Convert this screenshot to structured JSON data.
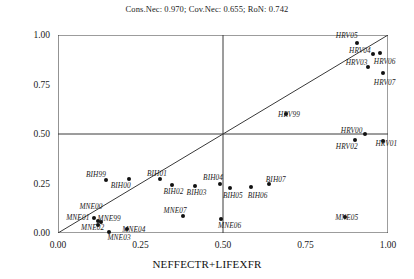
{
  "fit_stats": "Cons.Nec: 0.970; Cov.Nec: 0.655; RoN: 0.742",
  "axes": {
    "xlabel": "NEFFECTR+LIFEXFR",
    "ylabel": "OWNR",
    "xticks": [
      "0.00",
      "0.25",
      "0.50",
      "0.75",
      "1.00"
    ],
    "yticks": [
      "0.00",
      "0.25",
      "0.50",
      "0.75",
      "1.00"
    ]
  },
  "chart_data": {
    "type": "scatter",
    "title": "Cons.Nec: 0.970; Cov.Nec: 0.655; RoN: 0.742",
    "xlabel": "NEFFECTR+LIFEXFR",
    "ylabel": "OWNR",
    "xlim": [
      0.0,
      1.0
    ],
    "ylim": [
      0.0,
      1.0
    ],
    "xticks": [
      0.0,
      0.25,
      0.5,
      0.75,
      1.0
    ],
    "yticks": [
      0.0,
      0.25,
      0.5,
      0.75,
      1.0
    ],
    "grid": false,
    "legend": false,
    "reference_lines": [
      {
        "name": "diagonal",
        "type": "line",
        "from": [
          0.0,
          0.0
        ],
        "to": [
          1.0,
          1.0
        ]
      },
      {
        "name": "vline-0.50",
        "type": "vline",
        "x": 0.5
      },
      {
        "name": "hline-0.50",
        "type": "hline",
        "y": 0.5
      },
      {
        "name": "vline-1.00",
        "type": "vline",
        "x": 1.0
      },
      {
        "name": "hline-1.00",
        "type": "hline",
        "y": 1.0
      }
    ],
    "points": [
      {
        "label": "HRV05",
        "x": 0.905,
        "y": 0.96,
        "lx": 0.875,
        "ly": 1.0
      },
      {
        "label": "HRV04",
        "x": 0.955,
        "y": 0.905,
        "lx": 0.915,
        "ly": 0.925
      },
      {
        "label": "HRV06",
        "x": 0.975,
        "y": 0.91,
        "lx": 0.99,
        "ly": 0.87
      },
      {
        "label": "HRV03",
        "x": 0.94,
        "y": 0.84,
        "lx": 0.905,
        "ly": 0.865
      },
      {
        "label": "HRV07",
        "x": 0.985,
        "y": 0.81,
        "lx": 0.99,
        "ly": 0.765
      },
      {
        "label": "HRV99",
        "x": 0.69,
        "y": 0.6,
        "lx": 0.7,
        "ly": 0.6
      },
      {
        "label": "HRV00",
        "x": 0.93,
        "y": 0.5,
        "lx": 0.89,
        "ly": 0.52
      },
      {
        "label": "HRV01",
        "x": 0.985,
        "y": 0.465,
        "lx": 0.995,
        "ly": 0.455
      },
      {
        "label": "HRV02",
        "x": 0.9,
        "y": 0.47,
        "lx": 0.875,
        "ly": 0.44
      },
      {
        "label": "BIH99",
        "x": 0.145,
        "y": 0.27,
        "lx": 0.115,
        "ly": 0.3
      },
      {
        "label": "BIH00",
        "x": 0.215,
        "y": 0.275,
        "lx": 0.19,
        "ly": 0.24
      },
      {
        "label": "BIH01",
        "x": 0.31,
        "y": 0.275,
        "lx": 0.3,
        "ly": 0.305
      },
      {
        "label": "BIH02",
        "x": 0.345,
        "y": 0.24,
        "lx": 0.35,
        "ly": 0.21
      },
      {
        "label": "BIH03",
        "x": 0.415,
        "y": 0.235,
        "lx": 0.42,
        "ly": 0.205
      },
      {
        "label": "BIH04",
        "x": 0.49,
        "y": 0.25,
        "lx": 0.47,
        "ly": 0.285
      },
      {
        "label": "BIH05",
        "x": 0.52,
        "y": 0.225,
        "lx": 0.53,
        "ly": 0.19
      },
      {
        "label": "BIH06",
        "x": 0.585,
        "y": 0.23,
        "lx": 0.605,
        "ly": 0.19
      },
      {
        "label": "BIH07",
        "x": 0.64,
        "y": 0.245,
        "lx": 0.66,
        "ly": 0.275
      },
      {
        "label": "MNE00",
        "x": 0.11,
        "y": 0.075,
        "lx": 0.1,
        "ly": 0.135
      },
      {
        "label": "MNE99",
        "x": 0.13,
        "y": 0.055,
        "lx": 0.155,
        "ly": 0.075
      },
      {
        "label": "MNE01",
        "x": 0.12,
        "y": 0.06,
        "lx": 0.06,
        "ly": 0.08
      },
      {
        "label": "MNE02",
        "x": 0.12,
        "y": 0.04,
        "lx": 0.105,
        "ly": 0.03
      },
      {
        "label": "MNE03",
        "x": 0.155,
        "y": 0.005,
        "lx": 0.185,
        "ly": -0.02
      },
      {
        "label": "MNE04",
        "x": 0.21,
        "y": 0.02,
        "lx": 0.23,
        "ly": 0.02
      },
      {
        "label": "MNE07",
        "x": 0.38,
        "y": 0.085,
        "lx": 0.355,
        "ly": 0.115
      },
      {
        "label": "MNE06",
        "x": 0.495,
        "y": 0.07,
        "lx": 0.52,
        "ly": 0.04
      },
      {
        "label": "MNE05",
        "x": 0.87,
        "y": 0.08,
        "lx": 0.875,
        "ly": 0.08
      }
    ]
  }
}
